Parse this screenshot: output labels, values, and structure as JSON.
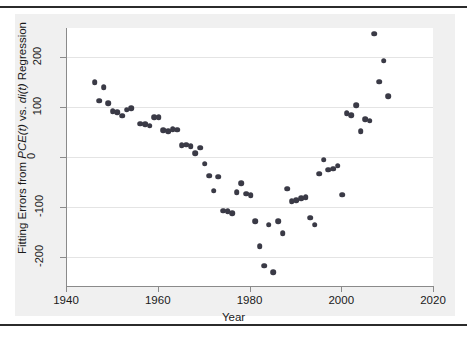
{
  "figure": {
    "background": "#f0f0f0",
    "plot_background": "#ffffff",
    "rule_color": "#2b2b2b",
    "marker_color": "#3a3a46",
    "grid_color": "#e4e4e4",
    "axis_color": "#8a8a8a"
  },
  "axis_titles": {
    "x": "Year",
    "y_plain": "Fitting Errors from PCE(t) vs. di(t) Regression",
    "y_parts": {
      "lead": "Fitting Errors from ",
      "italic1": "PCE(t)",
      "mid": " vs. ",
      "italic2": "di(t)",
      "tail": " Regression"
    }
  },
  "ticks": {
    "x": [
      "1940",
      "1960",
      "1980",
      "2000",
      "2020"
    ],
    "x_values": [
      1940,
      1960,
      1980,
      2000,
      2020
    ],
    "y": [
      "200",
      "100",
      "0",
      "-100",
      "-200"
    ],
    "y_values": [
      200,
      100,
      0,
      -100,
      -200
    ]
  },
  "chart_data": {
    "type": "scatter",
    "title": "",
    "xlabel": "Year",
    "ylabel": "Fitting Errors from PCE(t) vs. di(t) Regression",
    "xlim": [
      1935,
      2022
    ],
    "ylim": [
      -245,
      255
    ],
    "grid": true,
    "legend": "none",
    "series": [
      {
        "name": "Fitting errors",
        "points": [
          {
            "x": 1946,
            "y": 150
          },
          {
            "x": 1947,
            "y": 113
          },
          {
            "x": 1948,
            "y": 140
          },
          {
            "x": 1949,
            "y": 108
          },
          {
            "x": 1950,
            "y": 92
          },
          {
            "x": 1951,
            "y": 90
          },
          {
            "x": 1952,
            "y": 83
          },
          {
            "x": 1953,
            "y": 95
          },
          {
            "x": 1954,
            "y": 98
          },
          {
            "x": 1956,
            "y": 67
          },
          {
            "x": 1957,
            "y": 66
          },
          {
            "x": 1958,
            "y": 63
          },
          {
            "x": 1959,
            "y": 80
          },
          {
            "x": 1960,
            "y": 80
          },
          {
            "x": 1961,
            "y": 54
          },
          {
            "x": 1962,
            "y": 52
          },
          {
            "x": 1963,
            "y": 56
          },
          {
            "x": 1964,
            "y": 55
          },
          {
            "x": 1965,
            "y": 24
          },
          {
            "x": 1966,
            "y": 25
          },
          {
            "x": 1967,
            "y": 22
          },
          {
            "x": 1968,
            "y": 8
          },
          {
            "x": 1969,
            "y": 19
          },
          {
            "x": 1970,
            "y": -13
          },
          {
            "x": 1971,
            "y": -37
          },
          {
            "x": 1972,
            "y": -67
          },
          {
            "x": 1973,
            "y": -39
          },
          {
            "x": 1974,
            "y": -107
          },
          {
            "x": 1975,
            "y": -108
          },
          {
            "x": 1976,
            "y": -112
          },
          {
            "x": 1977,
            "y": -70
          },
          {
            "x": 1978,
            "y": -52
          },
          {
            "x": 1979,
            "y": -73
          },
          {
            "x": 1980,
            "y": -76
          },
          {
            "x": 1981,
            "y": -128
          },
          {
            "x": 1982,
            "y": -178
          },
          {
            "x": 1983,
            "y": -217
          },
          {
            "x": 1984,
            "y": -135
          },
          {
            "x": 1985,
            "y": -230
          },
          {
            "x": 1986,
            "y": -128
          },
          {
            "x": 1987,
            "y": -152
          },
          {
            "x": 1988,
            "y": -63
          },
          {
            "x": 1989,
            "y": -88
          },
          {
            "x": 1990,
            "y": -86
          },
          {
            "x": 1991,
            "y": -82
          },
          {
            "x": 1992,
            "y": -80
          },
          {
            "x": 1993,
            "y": -121
          },
          {
            "x": 1994,
            "y": -135
          },
          {
            "x": 1995,
            "y": -33
          },
          {
            "x": 1996,
            "y": -5
          },
          {
            "x": 1997,
            "y": -25
          },
          {
            "x": 1998,
            "y": -23
          },
          {
            "x": 1999,
            "y": -17
          },
          {
            "x": 2000,
            "y": -75
          },
          {
            "x": 2001,
            "y": 88
          },
          {
            "x": 2002,
            "y": 84
          },
          {
            "x": 2003,
            "y": 104
          },
          {
            "x": 2004,
            "y": 52
          },
          {
            "x": 2005,
            "y": 76
          },
          {
            "x": 2006,
            "y": 73
          },
          {
            "x": 2007,
            "y": 247
          },
          {
            "x": 2008,
            "y": 151
          },
          {
            "x": 2009,
            "y": 193
          },
          {
            "x": 2010,
            "y": 122
          }
        ]
      }
    ]
  }
}
